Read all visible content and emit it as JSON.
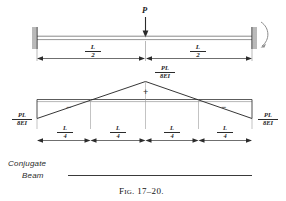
{
  "figure": {
    "caption_prefix": "F",
    "caption_smallcaps": "IG",
    "caption_number": ". 17–20.",
    "caption_full": "Fig. 17-20.",
    "diagram_label": "Conjugate",
    "diagram_label_line2": "Beam"
  },
  "beam": {
    "load_label": "P",
    "left_support": "fixed-support-hatched",
    "right_support": "fixed-support-hatched",
    "rotation_arc": "rotation-arc-arrow",
    "span_left": {
      "num": "L",
      "den": "2"
    },
    "span_right": {
      "num": "L",
      "den": "2"
    }
  },
  "conjugate": {
    "peak_label": {
      "num": "PL",
      "den": "8EI"
    },
    "left_end_label": {
      "num": "PL",
      "den": "8EI"
    },
    "right_end_label": {
      "num": "PL",
      "den": "8EI"
    },
    "sign_left": "−",
    "sign_center": "+",
    "sign_right": "−",
    "segments": [
      {
        "num": "L",
        "den": "4"
      },
      {
        "num": "L",
        "den": "4"
      },
      {
        "num": "L",
        "den": "4"
      },
      {
        "num": "L",
        "den": "4"
      }
    ]
  },
  "colors": {
    "ink": "#2b2b2b",
    "light_ink": "#6f6f6f",
    "paper": "#ffffff"
  }
}
